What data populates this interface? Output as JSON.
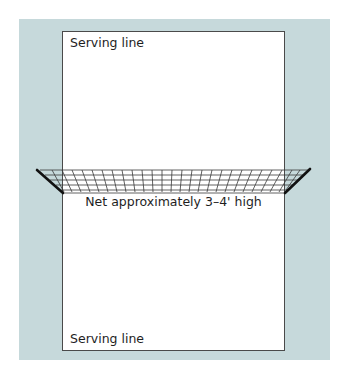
{
  "diagram": {
    "colors": {
      "background_panel": "#c6d9db",
      "court_fill": "#ffffff",
      "court_border": "#4a4a4a",
      "net_lines": "#333333",
      "poles": "#111111"
    },
    "court": {
      "top_label": "Serving line",
      "bottom_label": "Serving line"
    },
    "net": {
      "label": "Net approximately 3–4' high"
    }
  }
}
